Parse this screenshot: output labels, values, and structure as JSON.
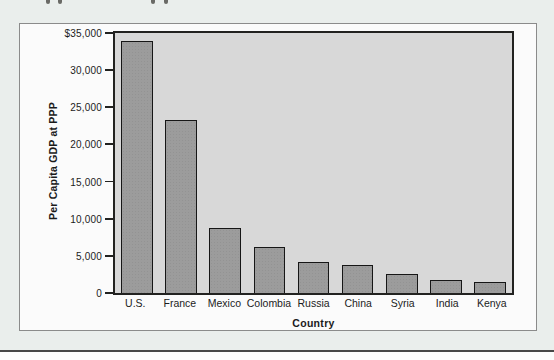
{
  "page": {
    "background_color": "#eaeeec",
    "frame_color": "#fbfbfb",
    "bottom_rule_color": "#474747"
  },
  "chart_data": {
    "type": "bar",
    "title": "",
    "xlabel": "Country",
    "ylabel": "Per Capita GDP at PPP",
    "categories": [
      "U.S.",
      "France",
      "Mexico",
      "Colombia",
      "Russia",
      "China",
      "Syria",
      "India",
      "Kenya"
    ],
    "values": [
      33900,
      23300,
      8700,
      6200,
      4200,
      3800,
      2500,
      1800,
      1500
    ],
    "ylim": [
      0,
      35000
    ],
    "yticks": [
      {
        "label": "$35,000",
        "value": 35000
      },
      {
        "label": "30,000",
        "value": 30000
      },
      {
        "label": "25,000",
        "value": 25000
      },
      {
        "label": "20,000",
        "value": 20000
      },
      {
        "label": "15,000",
        "value": 15000
      },
      {
        "label": "10,000",
        "value": 10000
      },
      {
        "label": "5,000",
        "value": 5000
      },
      {
        "label": "0",
        "value": 0
      }
    ],
    "grid": false,
    "legend": false,
    "bar_color": "#9c9c9c",
    "bar_border_color": "#161616",
    "plot_background": "#d8d8d8"
  }
}
